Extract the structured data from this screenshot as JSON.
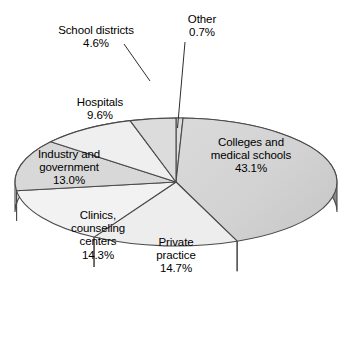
{
  "chart_data": {
    "type": "pie",
    "title": "",
    "xlabel": "",
    "ylabel": "",
    "legend_position": "none",
    "grid": false,
    "value_unit": "percent",
    "categories": [
      "Other",
      "Colleges and medical schools",
      "Private practice",
      "Clinics, counseling centers",
      "Industry and government",
      "Hospitals",
      "School districts"
    ],
    "values": [
      0.7,
      43.1,
      14.7,
      14.3,
      13.0,
      9.6,
      4.6
    ],
    "slices": [
      {
        "name": "Other",
        "value": 0.7,
        "value_label": "0.7%",
        "label_text": "Other\n0.7%",
        "fill": "#dcdcdc",
        "start_deg": 0.0,
        "end_deg": 2.52,
        "has_leader": true
      },
      {
        "name": "Colleges and medical schools",
        "value": 43.1,
        "value_label": "43.1%",
        "label_text": "Colleges and\nmedical schools\n43.1%",
        "fill": "#d3d3d3",
        "start_deg": 2.52,
        "end_deg": 157.68,
        "has_leader": false
      },
      {
        "name": "Private practice",
        "value": 14.7,
        "value_label": "14.7%",
        "label_text": "Private\npractice\n14.7%",
        "fill": "#ededed",
        "start_deg": 157.68,
        "end_deg": 210.6,
        "has_leader": false
      },
      {
        "name": "Clinics, counseling centers",
        "value": 14.3,
        "value_label": "14.3%",
        "label_text": "Clinics,\ncounseling\ncenters\n14.3%",
        "fill": "#f2f2f2",
        "start_deg": 210.6,
        "end_deg": 262.08,
        "has_leader": false
      },
      {
        "name": "Industry and government",
        "value": 13.0,
        "value_label": "13.0%",
        "label_text": "Industry and\ngovernment\n13.0%",
        "fill": "#d8d8d8",
        "start_deg": 262.08,
        "end_deg": 308.88,
        "has_leader": false
      },
      {
        "name": "Hospitals",
        "value": 9.6,
        "value_label": "9.6%",
        "label_text": "Hospitals\n9.6%",
        "fill": "#efefef",
        "start_deg": 308.88,
        "end_deg": 343.44,
        "has_leader": false
      },
      {
        "name": "School districts",
        "value": 4.6,
        "value_label": "4.6%",
        "label_text": "School districts\n4.6%",
        "fill": "#dcdcdc",
        "start_deg": 343.44,
        "end_deg": 360.0,
        "has_leader": true
      }
    ]
  },
  "geometry": {
    "cx": 176,
    "cy": 182,
    "rx": 161,
    "ry": 64,
    "depth": 30,
    "stroke": "#4a4a4a",
    "side_fill_light": "#d0d0d0",
    "side_fill_dark": "#8e8e8e"
  },
  "labels": {
    "other": {
      "text": "Other\n0.7%",
      "left": 167,
      "top": 13,
      "width": 70
    },
    "school_districts": {
      "text": "School districts\n4.6%",
      "left": 41,
      "top": 24,
      "width": 110
    },
    "hospitals": {
      "text": "Hospitals\n9.6%",
      "left": 62,
      "top": 96,
      "width": 76
    },
    "industry_government": {
      "text": "Industry and\ngovernment\n13.0%",
      "left": 21,
      "top": 148,
      "width": 96
    },
    "clinics": {
      "text": "Clinics,\ncounseling\ncenters\n14.3%",
      "left": 59,
      "top": 209,
      "width": 78
    },
    "private_practice": {
      "text": "Private\npractice\n14.7%",
      "left": 140,
      "top": 236,
      "width": 72
    },
    "colleges": {
      "text": "Colleges and\nmedical schools\n43.1%",
      "left": 193,
      "top": 136,
      "width": 116
    }
  }
}
